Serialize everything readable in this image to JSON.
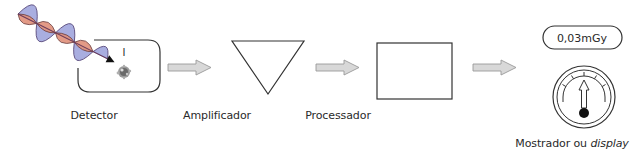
{
  "diagram": {
    "stages": [
      {
        "id": "detector",
        "label": "Detector"
      },
      {
        "id": "amplifier",
        "label": "Amplificador"
      },
      {
        "id": "processor",
        "label": "Processador"
      },
      {
        "id": "display",
        "label_main": "Mostrador ou ",
        "label_italic": "display"
      }
    ],
    "detector": {
      "current_symbol": "I"
    },
    "display": {
      "reading": "0,03mGy"
    },
    "colors": {
      "wave_vertical": "#a9aee0",
      "wave_horizontal": "#e0907a",
      "wave_overlap": "#8a5a8a",
      "arrow_fill": "#d8d8d8",
      "arrow_stroke": "#9a9a9a",
      "line": "#333333"
    }
  }
}
